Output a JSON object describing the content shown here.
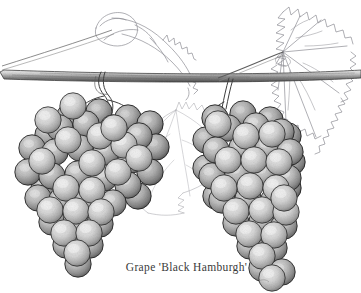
{
  "illustration": {
    "title": "Grape 'Black Hamburgh' botanical illustration",
    "medium": "pen-and-ink stipple drawing",
    "background_color": "#ffffff",
    "ink_color": "#2b2b2b",
    "grape_fill_light": "#d8d8d8",
    "grape_fill_mid": "#b4b4b4",
    "grape_shadow": "#4a4a4a",
    "leaf_outline_color": "#8d8d93",
    "branch_color": "#6e6e6e"
  },
  "caption": {
    "text": "Grape 'Black Hamburgh'",
    "common_name": "Grape",
    "cultivar": "Black Hamburgh"
  },
  "elements": {
    "branch_label": "woody vine branch",
    "left_leaf_label": "curled leaf upper left",
    "right_leaf_label": "large serrated grape leaf upper right",
    "center_leaf_label": "faint background leaf",
    "left_cluster_label": "left grape cluster",
    "right_cluster_label": "right grape cluster",
    "left_stem_label": "left cluster stem hooked over branch",
    "right_stem_label": "right cluster stem hooked over branch",
    "tendril_label": "tendril"
  }
}
